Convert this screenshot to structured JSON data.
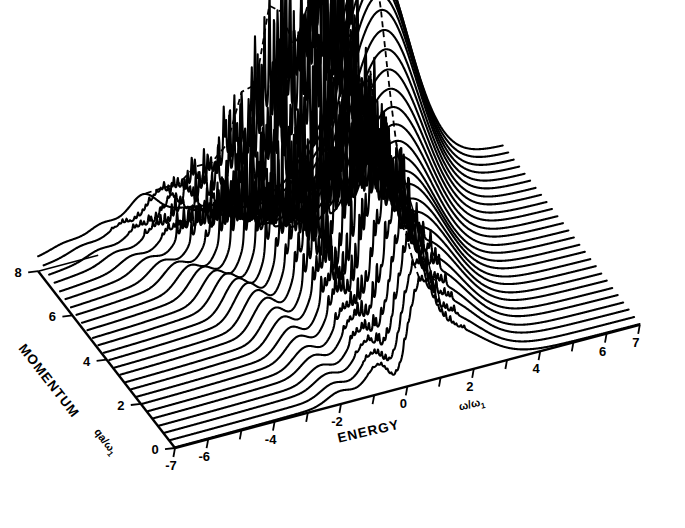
{
  "figure": {
    "kind": "waterfall-3d-spectrum",
    "background_color": "#ffffff",
    "line_color": "#000000"
  },
  "axes": {
    "energy": {
      "title": "ENERGY",
      "symbol": "ω/ω",
      "subscript": "1",
      "min": -7,
      "max": 7,
      "tick_values": [
        -7,
        -6,
        -5,
        -4,
        -3,
        -2,
        -1,
        0,
        1,
        2,
        3,
        4,
        5,
        6,
        7
      ],
      "labeled_ticks": [
        {
          "value": -7,
          "label": "-7"
        },
        {
          "value": -6,
          "label": "-6"
        },
        {
          "value": -4,
          "label": "-4"
        },
        {
          "value": -2,
          "label": "-2"
        },
        {
          "value": 0,
          "label": "0"
        },
        {
          "value": 2,
          "label": "2"
        },
        {
          "value": 4,
          "label": "4"
        },
        {
          "value": 6,
          "label": "6"
        },
        {
          "value": 7,
          "label": "7"
        }
      ]
    },
    "momentum": {
      "title": "MOMENTUM",
      "symbol": "qa/ω",
      "subscript": "1",
      "min": 0,
      "max": 8,
      "tick_values": [
        0,
        2,
        4,
        6,
        8
      ],
      "labeled_ticks": [
        {
          "value": 0,
          "label": "0"
        },
        {
          "value": 2,
          "label": "2"
        },
        {
          "value": 4,
          "label": "4"
        },
        {
          "value": 6,
          "label": "6"
        },
        {
          "value": 8,
          "label": "8"
        }
      ]
    }
  },
  "chart_data": {
    "type": "line",
    "title": "",
    "subtitle": "",
    "xlabel": "ENERGY ω/ω1",
    "ylabel": "MOMENTUM qa/ω1",
    "zlabel": "",
    "xlim": [
      -7,
      7
    ],
    "ylim": [
      0,
      8
    ],
    "grid": false,
    "legend": "none",
    "projection": "oblique-waterfall",
    "n_traces": 26,
    "trace_momentum_values": [
      0.0,
      0.32,
      0.64,
      0.96,
      1.28,
      1.6,
      1.92,
      2.24,
      2.56,
      2.88,
      3.2,
      3.52,
      3.84,
      4.16,
      4.48,
      4.8,
      5.12,
      5.44,
      5.76,
      6.08,
      6.4,
      6.72,
      7.04,
      7.36,
      7.68,
      8.0
    ],
    "x": [
      -7,
      -6.72,
      -6.44,
      -6.16,
      -5.88,
      -5.6,
      -5.32,
      -5.04,
      -4.76,
      -4.48,
      -4.2,
      -3.92,
      -3.64,
      -3.36,
      -3.08,
      -2.8,
      -2.52,
      -2.24,
      -1.96,
      -1.68,
      -1.4,
      -1.12,
      -0.84,
      -0.56,
      -0.28,
      0,
      0.28,
      0.56,
      0.84,
      1.12,
      1.4,
      1.68,
      1.96,
      2.24,
      2.52,
      2.8,
      3.08,
      3.36,
      3.64,
      3.92,
      4.2,
      4.48,
      4.76,
      5.04,
      5.32,
      5.6,
      5.88,
      6.16,
      6.44,
      6.72,
      7
    ],
    "series": [
      {
        "name": "q=0.00",
        "momentum": 0.0,
        "ridge_peak_energy": 0.35,
        "ridge_peak_height": 0.3,
        "broad_peak_energy": 1.1,
        "broad_peak_height": 0.22,
        "spike_density": 0.05,
        "tail_amp": 0.02
      },
      {
        "name": "q=0.32",
        "momentum": 0.32,
        "ridge_peak_energy": 0.32,
        "ridge_peak_height": 0.34,
        "broad_peak_energy": 1.15,
        "broad_peak_height": 0.25,
        "spike_density": 0.07,
        "tail_amp": 0.02
      },
      {
        "name": "q=0.64",
        "momentum": 0.64,
        "ridge_peak_energy": 0.3,
        "ridge_peak_height": 0.38,
        "broad_peak_energy": 1.2,
        "broad_peak_height": 0.28,
        "spike_density": 0.1,
        "tail_amp": 0.03
      },
      {
        "name": "q=0.96",
        "momentum": 0.96,
        "ridge_peak_energy": 0.26,
        "ridge_peak_height": 0.43,
        "broad_peak_energy": 1.25,
        "broad_peak_height": 0.31,
        "spike_density": 0.14,
        "tail_amp": 0.03
      },
      {
        "name": "q=1.28",
        "momentum": 1.28,
        "ridge_peak_energy": 0.22,
        "ridge_peak_height": 0.49,
        "broad_peak_energy": 1.3,
        "broad_peak_height": 0.34,
        "spike_density": 0.19,
        "tail_amp": 0.04
      },
      {
        "name": "q=1.60",
        "momentum": 1.6,
        "ridge_peak_energy": 0.16,
        "ridge_peak_height": 0.56,
        "broad_peak_energy": 1.35,
        "broad_peak_height": 0.37,
        "spike_density": 0.26,
        "tail_amp": 0.04
      },
      {
        "name": "q=1.92",
        "momentum": 1.92,
        "ridge_peak_energy": 0.1,
        "ridge_peak_height": 0.64,
        "broad_peak_energy": 1.4,
        "broad_peak_height": 0.4,
        "spike_density": 0.34,
        "tail_amp": 0.05
      },
      {
        "name": "q=2.24",
        "momentum": 2.24,
        "ridge_peak_energy": 0.04,
        "ridge_peak_height": 0.72,
        "broad_peak_energy": 1.45,
        "broad_peak_height": 0.43,
        "spike_density": 0.44,
        "tail_amp": 0.05
      },
      {
        "name": "q=2.56",
        "momentum": 2.56,
        "ridge_peak_energy": -0.04,
        "ridge_peak_height": 0.8,
        "broad_peak_energy": 1.5,
        "broad_peak_height": 0.46,
        "spike_density": 0.55,
        "tail_amp": 0.06
      },
      {
        "name": "q=2.88",
        "momentum": 2.88,
        "ridge_peak_energy": -0.12,
        "ridge_peak_height": 0.88,
        "broad_peak_energy": 1.55,
        "broad_peak_height": 0.49,
        "spike_density": 0.67,
        "tail_amp": 0.06
      },
      {
        "name": "q=3.20",
        "momentum": 3.2,
        "ridge_peak_energy": -0.22,
        "ridge_peak_height": 0.95,
        "broad_peak_energy": 1.6,
        "broad_peak_height": 0.52,
        "spike_density": 0.78,
        "tail_amp": 0.07
      },
      {
        "name": "q=3.52",
        "momentum": 3.52,
        "ridge_peak_energy": -0.34,
        "ridge_peak_height": 1.0,
        "broad_peak_energy": 1.65,
        "broad_peak_height": 0.55,
        "spike_density": 0.88,
        "tail_amp": 0.07
      },
      {
        "name": "q=3.84",
        "momentum": 3.84,
        "ridge_peak_energy": -0.46,
        "ridge_peak_height": 1.0,
        "broad_peak_energy": 1.7,
        "broad_peak_height": 0.58,
        "spike_density": 0.95,
        "tail_amp": 0.08
      },
      {
        "name": "q=4.16",
        "momentum": 4.16,
        "ridge_peak_energy": -0.6,
        "ridge_peak_height": 0.96,
        "broad_peak_energy": 1.8,
        "broad_peak_height": 0.62,
        "spike_density": 1.0,
        "tail_amp": 0.08
      },
      {
        "name": "q=4.48",
        "momentum": 4.48,
        "ridge_peak_energy": -0.76,
        "ridge_peak_height": 0.9,
        "broad_peak_energy": 1.9,
        "broad_peak_height": 0.66,
        "spike_density": 0.97,
        "tail_amp": 0.09
      },
      {
        "name": "q=4.80",
        "momentum": 4.8,
        "ridge_peak_energy": -0.94,
        "ridge_peak_height": 0.82,
        "broad_peak_energy": 2.0,
        "broad_peak_height": 0.71,
        "spike_density": 0.9,
        "tail_amp": 0.09
      },
      {
        "name": "q=5.12",
        "momentum": 5.12,
        "ridge_peak_energy": -1.14,
        "ridge_peak_height": 0.73,
        "broad_peak_energy": 2.1,
        "broad_peak_height": 0.76,
        "spike_density": 0.8,
        "tail_amp": 0.1
      },
      {
        "name": "q=5.44",
        "momentum": 5.44,
        "ridge_peak_energy": -1.36,
        "ridge_peak_height": 0.63,
        "broad_peak_energy": 2.2,
        "broad_peak_height": 0.82,
        "spike_density": 0.67,
        "tail_amp": 0.1
      },
      {
        "name": "q=5.76",
        "momentum": 5.76,
        "ridge_peak_energy": -1.6,
        "ridge_peak_height": 0.53,
        "broad_peak_energy": 2.3,
        "broad_peak_height": 0.88,
        "spike_density": 0.54,
        "tail_amp": 0.11
      },
      {
        "name": "q=6.08",
        "momentum": 6.08,
        "ridge_peak_energy": -1.86,
        "ridge_peak_height": 0.44,
        "broad_peak_energy": 2.4,
        "broad_peak_height": 0.94,
        "spike_density": 0.41,
        "tail_amp": 0.11
      },
      {
        "name": "q=6.40",
        "momentum": 6.4,
        "ridge_peak_energy": -2.14,
        "ridge_peak_height": 0.35,
        "broad_peak_energy": 2.5,
        "broad_peak_height": 1.0,
        "spike_density": 0.3,
        "tail_amp": 0.12
      },
      {
        "name": "q=6.72",
        "momentum": 6.72,
        "ridge_peak_energy": -2.44,
        "ridge_peak_height": 0.28,
        "broad_peak_energy": 2.6,
        "broad_peak_height": 1.04,
        "spike_density": 0.21,
        "tail_amp": 0.12
      },
      {
        "name": "q=7.04",
        "momentum": 7.04,
        "ridge_peak_energy": -2.76,
        "ridge_peak_height": 0.22,
        "broad_peak_energy": 2.7,
        "broad_peak_height": 1.07,
        "spike_density": 0.14,
        "tail_amp": 0.13
      },
      {
        "name": "q=7.36",
        "momentum": 7.36,
        "ridge_peak_energy": -3.1,
        "ridge_peak_height": 0.17,
        "broad_peak_energy": 2.8,
        "broad_peak_height": 1.09,
        "spike_density": 0.09,
        "tail_amp": 0.13
      },
      {
        "name": "q=7.68",
        "momentum": 7.68,
        "ridge_peak_energy": -3.46,
        "ridge_peak_height": 0.13,
        "broad_peak_energy": 2.9,
        "broad_peak_height": 1.1,
        "spike_density": 0.05,
        "tail_amp": 0.14
      },
      {
        "name": "q=8.00",
        "momentum": 8.0,
        "ridge_peak_energy": -3.84,
        "ridge_peak_height": 0.1,
        "broad_peak_energy": 3.0,
        "broad_peak_height": 1.1,
        "spike_density": 0.03,
        "tail_amp": 0.14
      }
    ],
    "annotations": [
      {
        "name": "upper-ridge-dashed-line",
        "style": "dashed",
        "描述": "dashed ridge tracking main peak maxima across traces"
      },
      {
        "name": "lower-ridge-dashed-line",
        "style": "dashed",
        "描述": "dashed ridge along low-momentum shoulder"
      }
    ]
  }
}
